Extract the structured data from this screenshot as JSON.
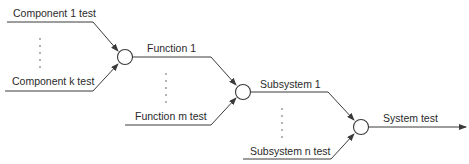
{
  "diagram": {
    "type": "integration-test-hierarchy",
    "colors": {
      "line": "#3a3a3a",
      "text": "#2a2a2a",
      "background": "#ffffff"
    },
    "stages": [
      {
        "name": "component",
        "inputs": [
          "Component 1 test",
          "Component k test"
        ],
        "ellipsis": "vertical-dots",
        "output": "Function 1"
      },
      {
        "name": "function",
        "inputs": [
          "Function 1",
          "Function m test"
        ],
        "ellipsis": "vertical-dots",
        "output": "Subsystem 1"
      },
      {
        "name": "subsystem",
        "inputs": [
          "Subsystem 1",
          "Subsystem n test"
        ],
        "ellipsis": "vertical-dots",
        "output": "System test"
      }
    ],
    "labels": {
      "component_1": "Component 1 test",
      "component_k": "Component k test",
      "function_1": "Function 1",
      "function_m": "Function m test",
      "subsystem_1": "Subsystem 1",
      "subsystem_n": "Subsystem n test",
      "system": "System test"
    },
    "icons": {
      "junction": "circle-node-icon",
      "arrow": "arrowhead-icon",
      "ellipsis": "vertical-ellipsis-icon"
    }
  }
}
